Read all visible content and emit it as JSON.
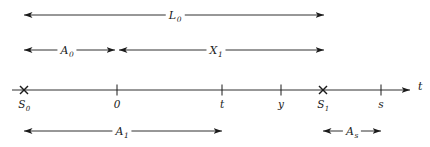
{
  "figure": {
    "type": "timeline-interval-diagram",
    "background_color": "#ffffff",
    "line_color": "#1a1a1a",
    "width": 430,
    "height": 147
  },
  "axis": {
    "name": "t",
    "x_start": 12,
    "x_end": 410,
    "y": 90,
    "ticks": [
      {
        "id": "S0",
        "label": "S",
        "sub": "0",
        "x": 24,
        "marker": "cross"
      },
      {
        "id": "zero",
        "label": "0",
        "sub": "",
        "x": 117,
        "marker": "tick"
      },
      {
        "id": "t",
        "label": "t",
        "sub": "",
        "x": 222,
        "marker": "tick"
      },
      {
        "id": "y",
        "label": "y",
        "sub": "",
        "x": 281,
        "marker": "tick"
      },
      {
        "id": "S1",
        "label": "S",
        "sub": "1",
        "x": 323,
        "marker": "cross"
      },
      {
        "id": "s",
        "label": "s",
        "sub": "",
        "x": 381,
        "marker": "tick"
      }
    ]
  },
  "intervals": [
    {
      "id": "L0",
      "label": "L",
      "sub": "0",
      "row": "top",
      "y": 15,
      "x1": 24,
      "x2": 324,
      "label_x": 175,
      "arrow_left": true,
      "arrow_right": true
    },
    {
      "id": "A0",
      "label": "A",
      "sub": "0",
      "row": "second",
      "y": 50,
      "x1": 24,
      "x2": 115,
      "label_x": 67,
      "arrow_left": true,
      "arrow_right": true
    },
    {
      "id": "X1",
      "label": "X",
      "sub": "1",
      "row": "second",
      "y": 50,
      "x1": 119,
      "x2": 324,
      "label_x": 216,
      "arrow_left": true,
      "arrow_right": true
    },
    {
      "id": "A1",
      "label": "A",
      "sub": "1",
      "row": "bottom",
      "y": 131,
      "x1": 24,
      "x2": 222,
      "label_x": 122,
      "arrow_left": true,
      "arrow_right": true
    },
    {
      "id": "As",
      "label": "A",
      "sub": "s",
      "row": "bottom",
      "y": 131,
      "x1": 323,
      "x2": 381,
      "label_x": 352,
      "arrow_left": true,
      "arrow_right": true
    }
  ]
}
